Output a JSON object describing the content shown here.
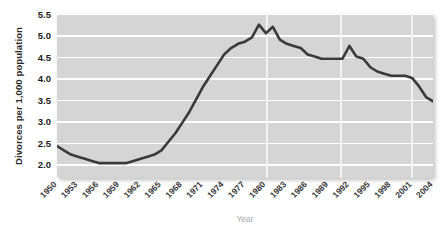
{
  "chart_data": {
    "type": "line",
    "title": "",
    "xlabel": "Year",
    "ylabel": "Divorces per 1,000 population",
    "ylim": [
      1.9,
      5.75
    ],
    "xlim": [
      1950,
      2004
    ],
    "yticks": [
      "2.0",
      "2.5",
      "3.0",
      "3.5",
      "4.0",
      "4.5",
      "5.0",
      "5.5"
    ],
    "ytick_values": [
      2.0,
      2.5,
      3.0,
      3.5,
      4.0,
      4.5,
      5.0,
      5.5
    ],
    "xticks": [
      "1950",
      "1953",
      "1956",
      "1959",
      "1962",
      "1965",
      "1968",
      "1971",
      "1974",
      "1977",
      "1980",
      "1983",
      "1986",
      "1989",
      "1992",
      "1995",
      "1998",
      "2001",
      "2004"
    ],
    "xtick_values": [
      1950,
      1953,
      1956,
      1959,
      1962,
      1965,
      1968,
      1971,
      1974,
      1977,
      1980,
      1983,
      1986,
      1989,
      1992,
      1995,
      1998,
      2001,
      2004
    ],
    "grid": "horizontal-white",
    "legend": "none",
    "series": [
      {
        "name": "Divorce rate",
        "color": "#3a3a3a",
        "x": [
          1950,
          1951,
          1952,
          1953,
          1954,
          1955,
          1956,
          1957,
          1958,
          1959,
          1960,
          1961,
          1962,
          1963,
          1964,
          1965,
          1966,
          1967,
          1968,
          1969,
          1970,
          1971,
          1972,
          1973,
          1974,
          1975,
          1976,
          1977,
          1978,
          1979,
          1980,
          1981,
          1982,
          1983,
          1984,
          1985,
          1986,
          1987,
          1988,
          1989,
          1990,
          1991,
          1992,
          1993,
          1994,
          1995,
          1996,
          1997,
          1998,
          1999,
          2000,
          2001,
          2002,
          2003,
          2004
        ],
        "values": [
          2.65,
          2.55,
          2.45,
          2.4,
          2.35,
          2.3,
          2.25,
          2.25,
          2.25,
          2.25,
          2.25,
          2.3,
          2.35,
          2.4,
          2.45,
          2.55,
          2.75,
          2.95,
          3.2,
          3.45,
          3.75,
          4.05,
          4.3,
          4.55,
          4.8,
          4.95,
          5.05,
          5.1,
          5.2,
          5.5,
          5.3,
          5.45,
          5.15,
          5.05,
          5.0,
          4.95,
          4.8,
          4.75,
          4.7,
          4.7,
          4.7,
          4.7,
          5.0,
          4.75,
          4.7,
          4.5,
          4.4,
          4.35,
          4.3,
          4.3,
          4.3,
          4.25,
          4.05,
          3.8,
          3.7
        ]
      }
    ]
  },
  "axes": {
    "ytitle": "Divorces per 1,000 population",
    "xtitle": "Year"
  },
  "colors": {
    "plot_background": "#d5d5d5",
    "gridline": "#ffffff",
    "line": "#3a3a3a",
    "xtitle_color": "#a9a9a9",
    "ytitle_color": "#2b2b2b",
    "page_background": "#ffffff"
  }
}
